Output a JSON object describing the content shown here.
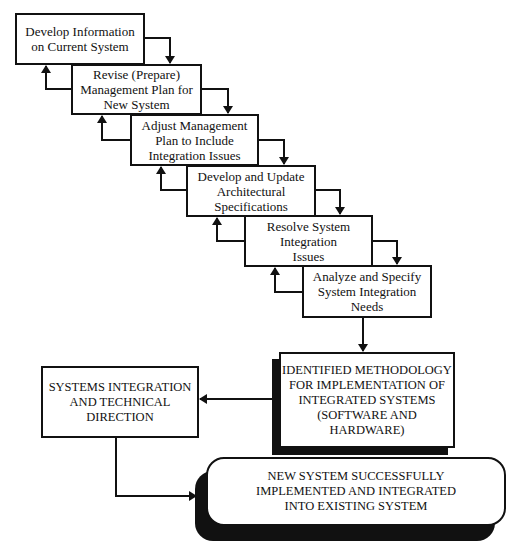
{
  "diagram": {
    "steps": [
      {
        "id": "step-1",
        "label": "Develop Information\non Current System"
      },
      {
        "id": "step-2",
        "label": "Revise (Prepare)\nManagement Plan for\nNew System"
      },
      {
        "id": "step-3",
        "label": "Adjust Management\nPlan to Include\nIntegration Issues"
      },
      {
        "id": "step-4",
        "label": "Develop and Update\nArchitectural\nSpecifications"
      },
      {
        "id": "step-5",
        "label": "Resolve System\nIntegration\nIssues"
      },
      {
        "id": "step-6",
        "label": "Analyze and Specify\nSystem Integration\nNeeds"
      }
    ],
    "methodology": {
      "label": "IDENTIFIED METHODOLOGY\nFOR IMPLEMENTATION OF\nINTEGRATED SYSTEMS\n(SOFTWARE AND\nHARDWARE)"
    },
    "direction": {
      "label": "SYSTEMS INTEGRATION\nAND TECHNICAL\nDIRECTION"
    },
    "outcome": {
      "label": "NEW SYSTEM SUCCESSFULLY\nIMPLEMENTED AND INTEGRATED\nINTO EXISTING SYSTEM"
    },
    "colors": {
      "line": "#111111",
      "background": "#ffffff",
      "shadow": "#111111"
    }
  }
}
